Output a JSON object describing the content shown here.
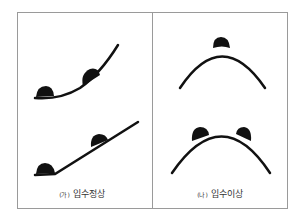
{
  "panels": [
    {
      "mark": "(가)",
      "caption": "입수정상"
    },
    {
      "mark": "(나)",
      "caption": "입수이상"
    }
  ],
  "colors": {
    "stroke": "#111111",
    "border": "#9a9a9a"
  }
}
